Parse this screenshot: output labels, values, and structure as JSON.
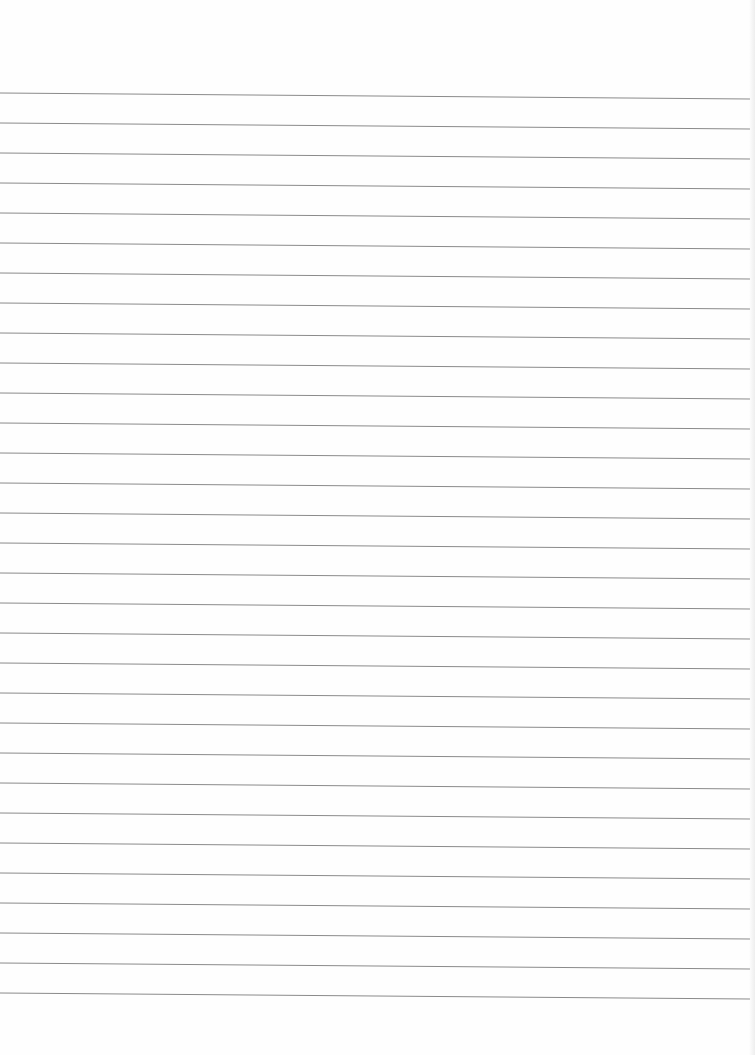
{
  "page": {
    "type": "blank lined paper",
    "background_color": "#fefefe",
    "line_color": "#8a8a8a",
    "line_count": 31,
    "first_line_y": 93,
    "line_spacing": 30,
    "line_slope_px": 6,
    "line_start_x": 0,
    "line_end_x": 750
  }
}
